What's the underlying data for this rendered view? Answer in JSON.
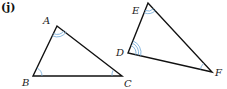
{
  "part_label": "(j)",
  "triangle1": {
    "A": "A",
    "B": "B",
    "C": "C"
  },
  "triangle2": {
    "D": "D",
    "E": "E",
    "F": "F"
  },
  "colors": {
    "stroke": "#111111",
    "arc": "#6fa8d8"
  }
}
